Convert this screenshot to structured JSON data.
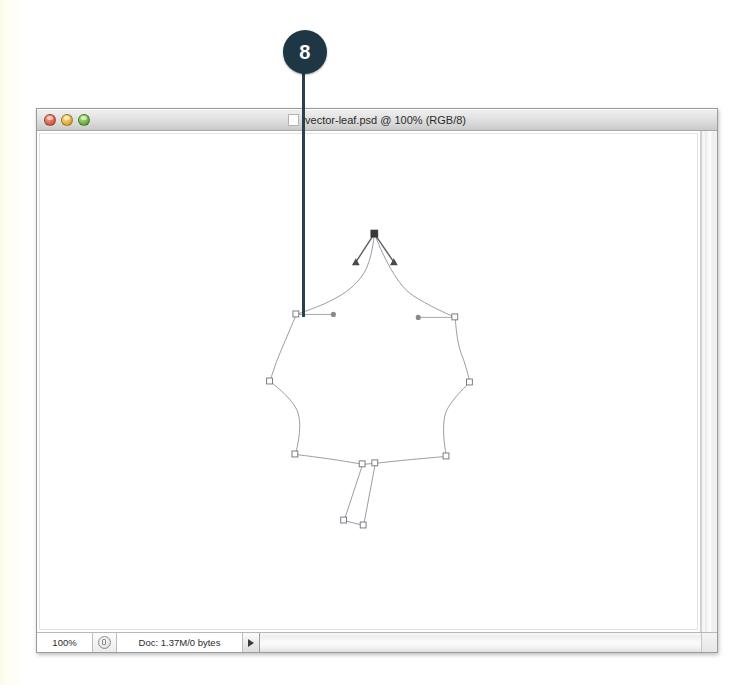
{
  "callout": {
    "number": "8",
    "badge_color": "#1f3644",
    "line_color": "#29414f"
  },
  "window": {
    "title": "vector-leaf.psd @ 100% (RGB/8)",
    "proxy_icon": "document-icon",
    "traffic_lights": [
      {
        "name": "close-button",
        "label": "Close",
        "color": "#d6543b"
      },
      {
        "name": "minimize-button",
        "label": "Minimize",
        "color": "#d9a428"
      },
      {
        "name": "zoom-button",
        "label": "Zoom",
        "color": "#5ca432"
      }
    ]
  },
  "statusbar": {
    "zoom_level": "100%",
    "status_icon": "gear-icon",
    "doc_info": "Doc: 1.37M/0 bytes",
    "expand_icon": "triangle-right-icon"
  },
  "artwork": {
    "name": "vector-leaf-path",
    "stroke_color": "#8d8d98",
    "anchor_fill": "#ffffff",
    "anchor_stroke": "#6d6d78",
    "selected_anchor_fill": "#3a3a3a",
    "leaf_outline": "M 383 234 C 383 234 381 260 372 274 C 358 296 330 306 303 316 C 303 316 290 345 284 358 C 279 371 276 384 276 384 C 276 384 293 397 301 409 C 311 424 302 458 302 458 C 302 458 338 462 371 468 C 371 468 379 467 384 467 C 384 467 418 463 457 460 C 457 460 450 424 460 409 C 468 396 481 385 481 385 C 481 385 478 372 473 358 C 467 344 466 319 466 319 C 466 319 437 307 420 295 C 399 280 383 234 383 234 Z",
    "stem_outline": "M 371 468 L 352 525 L 372 530 L 384 467",
    "anchors": [
      {
        "x": 383,
        "y": 234,
        "selected": true
      },
      {
        "x": 303,
        "y": 316,
        "selected": false
      },
      {
        "x": 276,
        "y": 384,
        "selected": false
      },
      {
        "x": 302,
        "y": 458,
        "selected": false
      },
      {
        "x": 371,
        "y": 468,
        "selected": false
      },
      {
        "x": 384,
        "y": 467,
        "selected": false
      },
      {
        "x": 352,
        "y": 525,
        "selected": false
      },
      {
        "x": 372,
        "y": 530,
        "selected": false
      },
      {
        "x": 457,
        "y": 460,
        "selected": false
      },
      {
        "x": 481,
        "y": 385,
        "selected": false
      },
      {
        "x": 466,
        "y": 319,
        "selected": false
      }
    ],
    "handles": [
      {
        "from_x": 383,
        "from_y": 234,
        "to_x": 364,
        "to_y": 262,
        "selected": true
      },
      {
        "from_x": 383,
        "from_y": 234,
        "to_x": 403,
        "to_y": 262,
        "selected": true
      },
      {
        "from_x": 303,
        "from_y": 316,
        "to_x": 341,
        "to_y": 316,
        "selected": false
      },
      {
        "from_x": 466,
        "from_y": 319,
        "to_x": 428,
        "to_y": 319,
        "selected": false
      }
    ]
  }
}
